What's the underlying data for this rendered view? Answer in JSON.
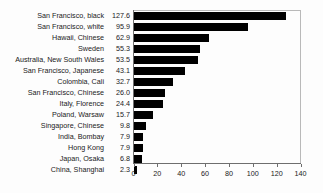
{
  "chart_data": {
    "type": "bar",
    "orientation": "horizontal",
    "title": "",
    "xlabel": "",
    "ylabel": "",
    "xlim": [
      0,
      140
    ],
    "xticks": [
      0,
      20,
      40,
      60,
      80,
      100,
      120,
      140
    ],
    "grid": false,
    "legend": null,
    "bar_color": "#000000",
    "axis_color": "#6e6e6e",
    "frame_color": "#b9b9b9",
    "background_color": "#fdfdfd",
    "value_labels_shown": true,
    "categories": [
      "San Francisco, black",
      "San Francisco, white",
      "Hawaii, Chinese",
      "Sweden",
      "Australia, New South Wales",
      "San Francisco, Japanese",
      "Colombia, Cali",
      "San Francisco, Chinese",
      "Italy, Florence",
      "Poland, Warsaw",
      "Singapore, Chinese",
      "India, Bombay",
      "Hong Kong",
      "Japan, Osaka",
      "China, Shanghai"
    ],
    "values": [
      127.6,
      95.9,
      62.9,
      55.3,
      53.5,
      43.1,
      32.7,
      26.0,
      24.4,
      15.7,
      9.8,
      7.9,
      7.9,
      6.8,
      2.3
    ],
    "value_labels": [
      "127.6",
      "95.9",
      "62.9",
      "55.3",
      "53.5",
      "43.1",
      "32.7",
      "26.0",
      "24.4",
      "15.7",
      "9.8",
      "7.9",
      "7.9",
      "6.8",
      "2.3"
    ],
    "tick_labels": [
      "0",
      "20",
      "40",
      "60",
      "80",
      "100",
      "120",
      "140"
    ]
  }
}
